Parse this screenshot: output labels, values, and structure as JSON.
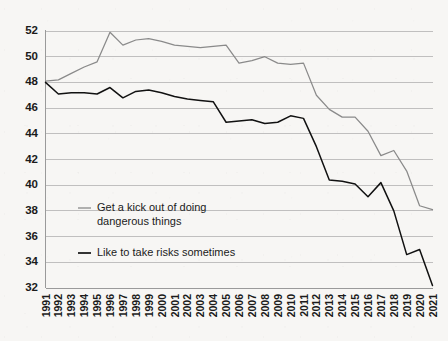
{
  "chart_data": {
    "type": "line",
    "title": "",
    "subtitle": "",
    "xlabel": "",
    "ylabel": "",
    "grid": true,
    "legend_position": "inside-lower-left",
    "xlim": [
      1991,
      2021
    ],
    "ylim": [
      32,
      52
    ],
    "ytick_step": 2,
    "yticks": [
      32,
      34,
      36,
      38,
      40,
      42,
      44,
      46,
      48,
      50,
      52
    ],
    "categories": [
      "1991",
      "1992",
      "1993",
      "1994",
      "1995",
      "1996",
      "1997",
      "1998",
      "1999",
      "2000",
      "2001",
      "2002",
      "2003",
      "2004",
      "2005",
      "2006",
      "2007",
      "2008",
      "2009",
      "2010",
      "2011",
      "2012",
      "2013",
      "2014",
      "2015",
      "2016",
      "2017",
      "2018",
      "2019",
      "2020",
      "2021"
    ],
    "series": [
      {
        "name": "Get a kick out of doing dangerous things",
        "color": "#8a8a8a",
        "values": [
          48.1,
          48.2,
          48.7,
          49.2,
          49.6,
          51.9,
          50.9,
          51.3,
          51.4,
          51.2,
          50.9,
          50.8,
          50.7,
          50.8,
          50.9,
          49.5,
          49.7,
          50.0,
          49.5,
          49.4,
          49.5,
          47.0,
          45.9,
          45.3,
          45.3,
          44.2,
          42.3,
          42.7,
          41.1,
          38.4,
          38.1
        ]
      },
      {
        "name": "Like to take risks sometimes",
        "color": "#111111",
        "values": [
          48.0,
          47.1,
          47.2,
          47.2,
          47.1,
          47.6,
          46.8,
          47.3,
          47.4,
          47.2,
          46.9,
          46.7,
          46.6,
          46.5,
          44.9,
          45.0,
          45.1,
          44.8,
          44.9,
          45.4,
          45.2,
          43.0,
          40.4,
          40.3,
          40.1,
          39.1,
          40.2,
          38.0,
          34.6,
          35.0,
          32.2
        ]
      }
    ]
  },
  "legend": {
    "entries": [
      {
        "label_line1": "Get a kick out of doing",
        "label_line2": "dangerous things",
        "color": "#8a8a8a"
      },
      {
        "label_line1": "Like to take risks sometimes",
        "label_line2": "",
        "color": "#111111"
      }
    ]
  }
}
